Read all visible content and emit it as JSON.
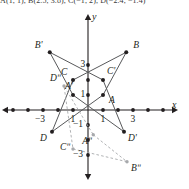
{
  "caption": {
    "text": "A(1, 1), B(2.5, 3.8), C(−1, 2), D(−2.4, −1.4)"
  },
  "axes": {
    "x_label": "x",
    "y_label": "y",
    "x_tick_labels": [
      {
        "value": -3,
        "text": "−3"
      },
      {
        "value": -1,
        "text": "1"
      },
      {
        "value": 1,
        "text": "1"
      },
      {
        "value": 3,
        "text": "3"
      }
    ],
    "y_tick_labels": [
      {
        "value": 3,
        "text": "3"
      },
      {
        "value": 1,
        "text": "1"
      },
      {
        "value": -1,
        "text": "−1"
      },
      {
        "value": -3,
        "text": "−3"
      }
    ],
    "x_ticks": [
      -5,
      -4,
      -3,
      -2,
      -1,
      1,
      2,
      3,
      4,
      5
    ],
    "y_ticks": [
      -3,
      -2,
      -1,
      1,
      2,
      3
    ],
    "origin_px": [
      88,
      110
    ],
    "unit_px": 15,
    "axis_color": "#231f20"
  },
  "chart_data": {
    "type": "scatter",
    "title": "",
    "xlabel": "x",
    "ylabel": "y",
    "xlim": [
      -5.9,
      6.7
    ],
    "ylim": [
      -4.7,
      6.7
    ],
    "grid": false,
    "legend": "none",
    "figures": [
      {
        "name": "original",
        "style": "solid",
        "color": "#58595b",
        "closed": true,
        "points": [
          {
            "label": "A",
            "x": 1.0,
            "y": 1.0,
            "label_dx": 6,
            "label_dy": 10
          },
          {
            "label": "B",
            "x": 2.55,
            "y": 3.85,
            "label_dx": 7,
            "label_dy": -2
          },
          {
            "label": "C",
            "x": -1.0,
            "y": 2.0,
            "label_dx": -12,
            "label_dy": -3
          },
          {
            "label": "D",
            "x": -2.4,
            "y": -1.45,
            "label_dx": -12,
            "label_dy": 11
          }
        ]
      },
      {
        "name": "reflection-prime",
        "style": "solid",
        "color": "#58595b",
        "closed": true,
        "points": [
          {
            "label": "A'",
            "x": -1.0,
            "y": 1.0,
            "label_dx": -8,
            "label_dy": -4
          },
          {
            "label": "B'",
            "x": -2.55,
            "y": 3.85,
            "label_dx": -15,
            "label_dy": -2
          },
          {
            "label": "C'",
            "x": 1.0,
            "y": 2.0,
            "label_dx": 4,
            "label_dy": -4
          },
          {
            "label": "D'",
            "x": 2.4,
            "y": -1.45,
            "label_dx": 4,
            "label_dy": 11
          }
        ]
      },
      {
        "name": "reflection-double-prime",
        "style": "dashed",
        "color": "#a7a9ac",
        "closed": true,
        "points": [
          {
            "label": "Aʺ",
            "x": 0.35,
            "y": -1.65,
            "label_dx": -11,
            "label_dy": 11
          },
          {
            "label": "Bʺ",
            "x": 2.6,
            "y": -3.45,
            "label_dx": 4,
            "label_dy": 11
          },
          {
            "label": "Cʺ",
            "x": -1.0,
            "y": -2.6,
            "label_dx": -13,
            "label_dy": 3
          },
          {
            "label": "Dʺ",
            "x": -1.6,
            "y": 1.6,
            "label_dx": -14,
            "label_dy": -3
          }
        ]
      }
    ]
  }
}
